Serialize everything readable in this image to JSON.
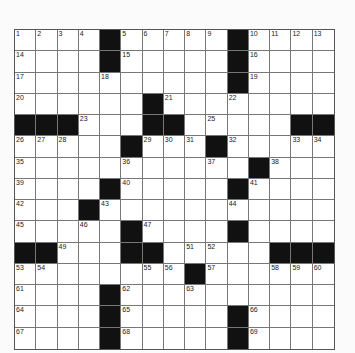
{
  "puzzle": {
    "rows": 15,
    "cols": 15,
    "grid": [
      "....#.....#....",
      "....#.....#....",
      "..........#....",
      "......#........",
      "###...##.....##",
      ".....#...#.....",
      "...........#...",
      "....#.....#....",
      "...#...........",
      ".....#....#....",
      "##...##.....###",
      "........#......",
      "....#..........",
      "....#.....#....",
      "....#.....#...."
    ],
    "numbers": [
      {
        "r": 0,
        "c": 0,
        "n": "1"
      },
      {
        "r": 0,
        "c": 1,
        "n": "2"
      },
      {
        "r": 0,
        "c": 2,
        "n": "3"
      },
      {
        "r": 0,
        "c": 3,
        "n": "4"
      },
      {
        "r": 0,
        "c": 5,
        "n": "5"
      },
      {
        "r": 0,
        "c": 6,
        "n": "6"
      },
      {
        "r": 0,
        "c": 7,
        "n": "7"
      },
      {
        "r": 0,
        "c": 8,
        "n": "8"
      },
      {
        "r": 0,
        "c": 9,
        "n": "9"
      },
      {
        "r": 0,
        "c": 11,
        "n": "10"
      },
      {
        "r": 0,
        "c": 12,
        "n": "11"
      },
      {
        "r": 0,
        "c": 13,
        "n": "12"
      },
      {
        "r": 0,
        "c": 14,
        "n": "13"
      },
      {
        "r": 1,
        "c": 0,
        "n": "14"
      },
      {
        "r": 1,
        "c": 5,
        "n": "15"
      },
      {
        "r": 1,
        "c": 11,
        "n": "16"
      },
      {
        "r": 2,
        "c": 0,
        "n": "17"
      },
      {
        "r": 2,
        "c": 4,
        "n": "18"
      },
      {
        "r": 2,
        "c": 11,
        "n": "19"
      },
      {
        "r": 3,
        "c": 0,
        "n": "20"
      },
      {
        "r": 3,
        "c": 7,
        "n": "21"
      },
      {
        "r": 3,
        "c": 10,
        "n": "22"
      },
      {
        "r": 4,
        "c": 3,
        "n": "23"
      },
      {
        "r": 4,
        "c": 6,
        "n": "24"
      },
      {
        "r": 4,
        "c": 9,
        "n": "25"
      },
      {
        "r": 5,
        "c": 0,
        "n": "26"
      },
      {
        "r": 5,
        "c": 1,
        "n": "27"
      },
      {
        "r": 5,
        "c": 2,
        "n": "28"
      },
      {
        "r": 5,
        "c": 6,
        "n": "29"
      },
      {
        "r": 5,
        "c": 7,
        "n": "30"
      },
      {
        "r": 5,
        "c": 8,
        "n": "31"
      },
      {
        "r": 5,
        "c": 10,
        "n": "32"
      },
      {
        "r": 5,
        "c": 13,
        "n": "33"
      },
      {
        "r": 5,
        "c": 14,
        "n": "34"
      },
      {
        "r": 6,
        "c": 0,
        "n": "35"
      },
      {
        "r": 6,
        "c": 5,
        "n": "36"
      },
      {
        "r": 6,
        "c": 9,
        "n": "37"
      },
      {
        "r": 6,
        "c": 12,
        "n": "38"
      },
      {
        "r": 7,
        "c": 0,
        "n": "39"
      },
      {
        "r": 7,
        "c": 5,
        "n": "40"
      },
      {
        "r": 7,
        "c": 11,
        "n": "41"
      },
      {
        "r": 8,
        "c": 0,
        "n": "42"
      },
      {
        "r": 8,
        "c": 4,
        "n": "43"
      },
      {
        "r": 8,
        "c": 10,
        "n": "44"
      },
      {
        "r": 9,
        "c": 0,
        "n": "45"
      },
      {
        "r": 9,
        "c": 3,
        "n": "46"
      },
      {
        "r": 9,
        "c": 6,
        "n": "47"
      },
      {
        "r": 9,
        "c": 10,
        "n": "48"
      },
      {
        "r": 10,
        "c": 2,
        "n": "49"
      },
      {
        "r": 10,
        "c": 5,
        "n": "50"
      },
      {
        "r": 10,
        "c": 8,
        "n": "51"
      },
      {
        "r": 10,
        "c": 9,
        "n": "52"
      },
      {
        "r": 11,
        "c": 0,
        "n": "53"
      },
      {
        "r": 11,
        "c": 1,
        "n": "54"
      },
      {
        "r": 11,
        "c": 6,
        "n": "55"
      },
      {
        "r": 11,
        "c": 7,
        "n": "56"
      },
      {
        "r": 11,
        "c": 9,
        "n": "57"
      },
      {
        "r": 11,
        "c": 12,
        "n": "58"
      },
      {
        "r": 11,
        "c": 13,
        "n": "59"
      },
      {
        "r": 11,
        "c": 14,
        "n": "60"
      },
      {
        "r": 12,
        "c": 0,
        "n": "61"
      },
      {
        "r": 12,
        "c": 5,
        "n": "62"
      },
      {
        "r": 12,
        "c": 8,
        "n": "63"
      },
      {
        "r": 13,
        "c": 0,
        "n": "64"
      },
      {
        "r": 13,
        "c": 5,
        "n": "65"
      },
      {
        "r": 13,
        "c": 11,
        "n": "66"
      },
      {
        "r": 14,
        "c": 0,
        "n": "67"
      },
      {
        "r": 14,
        "c": 5,
        "n": "68"
      },
      {
        "r": 14,
        "c": 11,
        "n": "69"
      }
    ]
  },
  "colors": {
    "block": "#111111",
    "cell": "#ffffff",
    "line": "#777777"
  }
}
